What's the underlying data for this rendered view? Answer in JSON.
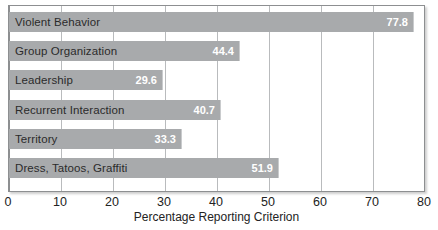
{
  "chart_data": {
    "type": "bar",
    "orientation": "horizontal",
    "title": "",
    "xlabel": "Percentage Reporting Criterion",
    "ylabel": "",
    "xlim": [
      0,
      80
    ],
    "xticks": [
      0,
      10,
      20,
      30,
      40,
      50,
      60,
      70,
      80
    ],
    "xtick_labels": [
      "0",
      "10",
      "20",
      "30",
      "40",
      "50",
      "60",
      "70",
      "80"
    ],
    "grid": "vertical",
    "legend": "none",
    "categories": [
      "Violent Behavior",
      "Group Organization",
      "Leadership",
      "Recurrent Interaction",
      "Territory",
      "Dress, Tatoos, Graffiti"
    ],
    "values": [
      77.8,
      44.4,
      29.6,
      40.7,
      33.3,
      51.9
    ],
    "value_labels": [
      "77.8",
      "44.4",
      "29.6",
      "40.7",
      "33.3",
      "51.9"
    ],
    "colors": {
      "bar_fill": "#a8aaac",
      "plot_background": "#ffffff",
      "frame": "#8d8f91",
      "gridline": "#b9bbbd",
      "value_label": "#ffffff",
      "category_label": "#2b2b2b",
      "axis_text": "#232323"
    }
  }
}
